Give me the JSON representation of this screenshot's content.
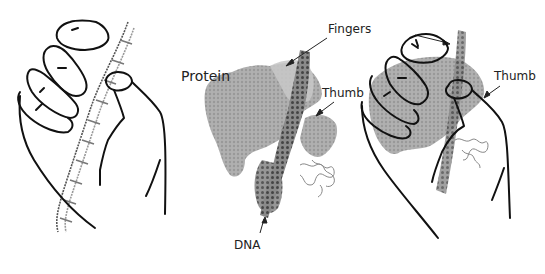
{
  "diagram": {
    "panels": [
      {
        "id": "left",
        "description": "Drawing of a hand grasping a DNA double helix"
      },
      {
        "id": "middle",
        "description": "Molecular surface model of a polymerase protein bound to DNA"
      },
      {
        "id": "right",
        "description": "Hand drawing overlaid on the protein model"
      }
    ],
    "labels": {
      "fingers": "Fingers",
      "protein": "Protein",
      "thumb_middle": "Thumb",
      "thumb_right": "Thumb",
      "dna": "DNA"
    },
    "colors": {
      "outline": "#111111",
      "protein": "#a8a8a8",
      "protein_light": "#c8c8c8",
      "dna_dark": "#555555",
      "dna_light": "#9a9a9a"
    }
  }
}
